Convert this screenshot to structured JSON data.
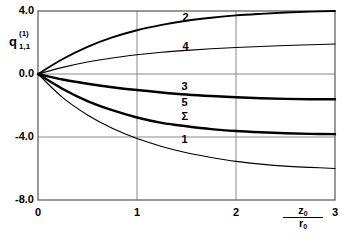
{
  "chart_data": {
    "type": "line",
    "title": "",
    "subtitle": "",
    "xlabel": "z0/r0",
    "xlabel_num": "z",
    "xlabel_num_sub": "0",
    "xlabel_den": "r",
    "xlabel_den_sub": "0",
    "ylabel": "q(1)1,1",
    "ylabel_base": "q",
    "ylabel_sup": "(1)",
    "ylabel_sub": "1,1",
    "xlim": [
      0,
      3
    ],
    "ylim": [
      -8.0,
      4.0
    ],
    "xticks": [
      0,
      1,
      2,
      3
    ],
    "xtick_labels": [
      "0",
      "1",
      "2",
      "3"
    ],
    "yticks": [
      4.0,
      0.0,
      -4.0,
      -8.0
    ],
    "ytick_labels": [
      "4.0",
      "0.0",
      "-4.0",
      "-8.0"
    ],
    "grid": true,
    "grid_color": "#888888",
    "legend_position": "inline-labels",
    "line_color": "#000000",
    "series": [
      {
        "name": "2",
        "label": "2",
        "label_x": 1.46,
        "label_y": 3.55,
        "width": 1.9,
        "x": [
          0,
          0.25,
          0.5,
          0.75,
          1.0,
          1.25,
          1.5,
          1.75,
          2.0,
          2.25,
          2.5,
          2.75,
          3.0
        ],
        "y": [
          0.0,
          0.95,
          1.72,
          2.32,
          2.78,
          3.12,
          3.38,
          3.57,
          3.72,
          3.82,
          3.9,
          3.96,
          4.0
        ]
      },
      {
        "name": "4",
        "label": "4",
        "label_x": 1.46,
        "label_y": 1.72,
        "width": 1.1,
        "x": [
          0,
          0.25,
          0.5,
          0.75,
          1.0,
          1.25,
          1.5,
          1.75,
          2.0,
          2.25,
          2.5,
          2.75,
          3.0
        ],
        "y": [
          0.0,
          0.42,
          0.76,
          1.02,
          1.22,
          1.38,
          1.5,
          1.6,
          1.68,
          1.75,
          1.81,
          1.86,
          1.9
        ]
      },
      {
        "name": "3",
        "label": "3",
        "label_x": 1.45,
        "label_y": -0.85,
        "width": 2.4,
        "x": [
          0,
          0.25,
          0.5,
          0.75,
          1.0,
          1.25,
          1.5,
          1.75,
          2.0,
          2.25,
          2.5,
          2.75,
          3.0
        ],
        "y": [
          0.0,
          -0.35,
          -0.62,
          -0.84,
          -1.02,
          -1.17,
          -1.3,
          -1.4,
          -1.48,
          -1.54,
          -1.58,
          -1.6,
          -1.6
        ]
      },
      {
        "name": "5",
        "label": "5",
        "label_x": 1.45,
        "label_y": -1.85,
        "width": 1.0,
        "x": [
          0,
          0.25,
          0.5,
          0.75,
          1.0,
          1.25,
          1.5,
          1.75,
          2.0,
          2.25,
          2.5,
          2.75,
          3.0
        ],
        "y": [
          0.0,
          -0.35,
          -0.62,
          -0.84,
          -1.02,
          -1.17,
          -1.3,
          -1.4,
          -1.48,
          -1.54,
          -1.58,
          -1.6,
          -1.6
        ]
      },
      {
        "name": "Sigma",
        "label": "Σ",
        "label_x": 1.45,
        "label_y": -2.72,
        "width": 2.4,
        "x": [
          0,
          0.25,
          0.5,
          0.75,
          1.0,
          1.25,
          1.5,
          1.75,
          2.0,
          2.25,
          2.5,
          2.75,
          3.0
        ],
        "y": [
          0.0,
          -0.95,
          -1.72,
          -2.3,
          -2.76,
          -3.1,
          -3.32,
          -3.5,
          -3.62,
          -3.7,
          -3.76,
          -3.8,
          -3.82
        ]
      },
      {
        "name": "1",
        "label": "1",
        "label_x": 1.45,
        "label_y": -4.2,
        "width": 1.1,
        "x": [
          0,
          0.25,
          0.5,
          0.75,
          1.0,
          1.25,
          1.5,
          1.75,
          2.0,
          2.25,
          2.5,
          2.75,
          3.0
        ],
        "y": [
          0.0,
          -1.5,
          -2.6,
          -3.45,
          -4.1,
          -4.6,
          -5.0,
          -5.3,
          -5.55,
          -5.72,
          -5.85,
          -5.93,
          -6.0
        ]
      }
    ]
  }
}
